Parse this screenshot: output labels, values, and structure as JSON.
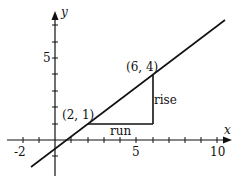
{
  "diagram": {
    "type": "slope-rise-run",
    "axes": {
      "x_label": "x",
      "y_label": "y",
      "x_ticks": [
        "-2",
        "5",
        "10"
      ],
      "y_ticks": [
        "5"
      ]
    },
    "points": [
      {
        "label": "(2, 1)",
        "x": 2,
        "y": 1
      },
      {
        "label": "(6, 4)",
        "x": 6,
        "y": 4
      }
    ],
    "annotations": {
      "run": "run",
      "rise": "rise"
    },
    "colors": {
      "ink": "#111111",
      "background": "#ffffff"
    }
  }
}
